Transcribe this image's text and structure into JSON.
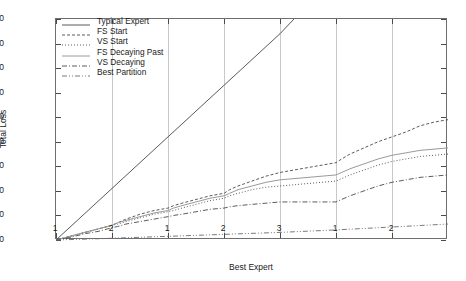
{
  "chart_data": {
    "type": "line",
    "title": "",
    "xlabel": "Best Expert",
    "ylabel": "Total Loss",
    "ylim": [
      0,
      180
    ],
    "yticks": [
      0,
      20,
      40,
      60,
      80,
      100,
      120,
      140,
      160,
      180
    ],
    "xlim": [
      0,
      7
    ],
    "xticks": [
      0,
      1,
      2,
      3,
      4,
      5,
      6
    ],
    "xticklabels": [
      "1",
      "2",
      "1",
      "2",
      "3",
      "1",
      "2"
    ],
    "grid": "vertical",
    "legend_position": "upper-left-inside",
    "series": [
      {
        "name": "Typical Expert",
        "style": "solid",
        "color": "#5a5a5a",
        "x": [
          0,
          0.5,
          1,
          1.5,
          2,
          2.5,
          3,
          3.5,
          4,
          4.25
        ],
        "values": [
          0,
          21,
          42,
          63,
          84,
          105,
          126,
          147,
          168,
          180
        ]
      },
      {
        "name": "FS Start",
        "style": "dashed",
        "color": "#4a4a4a",
        "x": [
          0,
          0.25,
          0.5,
          0.75,
          1,
          1.1,
          1.25,
          1.5,
          1.75,
          2,
          2.1,
          2.25,
          2.5,
          2.75,
          3,
          3.1,
          3.25,
          3.5,
          3.75,
          4,
          4.25,
          4.5,
          4.75,
          5,
          5.1,
          5.25,
          5.5,
          5.75,
          6,
          6.25,
          6.5,
          6.75,
          7
        ],
        "values": [
          0,
          3,
          6,
          9,
          12,
          14,
          17,
          21,
          24,
          26,
          28,
          30,
          33,
          36,
          38,
          41,
          44,
          48,
          52,
          55,
          57,
          59,
          61,
          63,
          66,
          70,
          75,
          80,
          84,
          88,
          93,
          96,
          98
        ]
      },
      {
        "name": "VS Start",
        "style": "dotted",
        "color": "#4a4a4a",
        "x": [
          0,
          0.25,
          0.5,
          0.75,
          1,
          1.1,
          1.25,
          1.5,
          1.75,
          2,
          2.1,
          2.25,
          2.5,
          2.75,
          3,
          3.1,
          3.25,
          3.5,
          3.75,
          4,
          4.25,
          4.5,
          4.75,
          5,
          5.1,
          5.25,
          5.5,
          5.75,
          6,
          6.25,
          6.5,
          6.75,
          7
        ],
        "values": [
          0,
          3,
          6,
          9,
          12,
          13,
          15,
          18,
          21,
          23,
          24,
          26,
          29,
          32,
          34,
          36,
          38,
          41,
          43,
          44,
          45,
          46,
          47,
          48,
          50,
          53,
          57,
          61,
          64,
          66,
          68,
          69,
          70
        ]
      },
      {
        "name": "FS Decaying Past",
        "style": "solid-light",
        "color": "#9a9a9a",
        "x": [
          0,
          0.25,
          0.5,
          0.75,
          1,
          1.1,
          1.25,
          1.5,
          1.75,
          2,
          2.1,
          2.25,
          2.5,
          2.75,
          3,
          3.1,
          3.25,
          3.5,
          3.75,
          4,
          4.25,
          4.5,
          4.75,
          5,
          5.1,
          5.25,
          5.5,
          5.75,
          6,
          6.25,
          6.5,
          6.75,
          7
        ],
        "values": [
          0,
          3,
          6,
          9,
          12,
          14,
          16,
          19,
          22,
          24,
          26,
          28,
          31,
          34,
          36,
          38,
          41,
          44,
          47,
          49,
          50,
          51,
          52,
          53,
          55,
          58,
          62,
          66,
          69,
          71,
          73,
          74,
          75
        ]
      },
      {
        "name": "VS Decaying",
        "style": "dashdot",
        "color": "#4a4a4a",
        "x": [
          0,
          0.25,
          0.5,
          0.75,
          1,
          1.1,
          1.25,
          1.5,
          1.75,
          2,
          2.1,
          2.25,
          2.5,
          2.75,
          3,
          3.1,
          3.25,
          3.5,
          3.75,
          4,
          4.25,
          4.5,
          4.75,
          5,
          5.1,
          5.25,
          5.5,
          5.75,
          6,
          6.25,
          6.5,
          6.75,
          7
        ],
        "values": [
          0,
          2,
          5,
          7,
          10,
          11,
          13,
          15,
          17,
          19,
          20,
          21,
          23,
          25,
          26,
          27,
          28,
          29,
          30,
          31,
          31,
          31,
          31,
          31,
          33,
          36,
          40,
          44,
          47,
          49,
          51,
          52,
          53
        ]
      },
      {
        "name": "Best Partition",
        "style": "dashdotdot",
        "color": "#6a6a6a",
        "x": [
          0,
          0.5,
          1,
          1.5,
          2,
          2.5,
          3,
          3.5,
          4,
          4.5,
          5,
          5.5,
          6,
          6.5,
          7
        ],
        "values": [
          0,
          0.7,
          1.4,
          2.2,
          3,
          3.8,
          4.6,
          5.4,
          6.2,
          7.2,
          8.2,
          9.4,
          10.6,
          11.8,
          13
        ]
      }
    ]
  }
}
